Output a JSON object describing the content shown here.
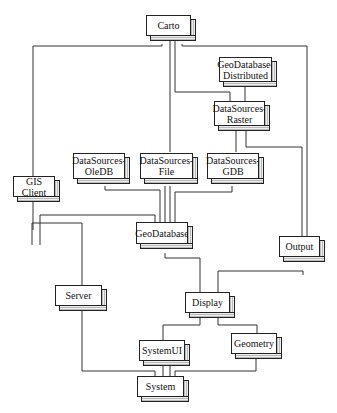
{
  "diagram": {
    "type": "module-dependency-diagram",
    "nodes": {
      "carto": {
        "label": "Carto"
      },
      "geodatabase_distributed": {
        "label": "GeoDatabase-\nDistributed",
        "line1": "GeoDatabase-",
        "line2": "Distributed"
      },
      "datasources_raster": {
        "label": "DataSources-\nRaster",
        "line1": "DataSources-",
        "line2": "Raster"
      },
      "datasources_oledb": {
        "label": "DataSources-\nOleDB",
        "line1": "DataSources-",
        "line2": "OleDB"
      },
      "datasources_file": {
        "label": "DataSources-\nFile",
        "line1": "DataSources-",
        "line2": "File"
      },
      "datasources_gdb": {
        "label": "DataSources-\nGDB",
        "line1": "DataSources-",
        "line2": "GDB"
      },
      "gis_client": {
        "label": "GIS Client"
      },
      "geodatabase": {
        "label": "GeoDatabase"
      },
      "output": {
        "label": "Output"
      },
      "server": {
        "label": "Server"
      },
      "display": {
        "label": "Display"
      },
      "geometry": {
        "label": "Geometry"
      },
      "systemui": {
        "label": "SystemUI"
      },
      "system": {
        "label": "System"
      }
    },
    "edges": [
      [
        "Carto",
        "GIS Client"
      ],
      [
        "Carto",
        "DataSources-File"
      ],
      [
        "Carto",
        "DataSources-Raster"
      ],
      [
        "Carto",
        "Output"
      ],
      [
        "GeoDatabase-Distributed",
        "DataSources-Raster"
      ],
      [
        "DataSources-Raster",
        "DataSources-GDB"
      ],
      [
        "DataSources-Raster",
        "Output"
      ],
      [
        "DataSources-OleDB",
        "GeoDatabase"
      ],
      [
        "DataSources-File",
        "GeoDatabase"
      ],
      [
        "DataSources-GDB",
        "GeoDatabase"
      ],
      [
        "GIS Client",
        "GeoDatabase"
      ],
      [
        "GIS Client",
        "Server"
      ],
      [
        "GeoDatabase",
        "Display"
      ],
      [
        "Output",
        "Display"
      ],
      [
        "Server",
        "System"
      ],
      [
        "Display",
        "SystemUI"
      ],
      [
        "Display",
        "Geometry"
      ],
      [
        "SystemUI",
        "System"
      ],
      [
        "Geometry",
        "System"
      ]
    ]
  }
}
